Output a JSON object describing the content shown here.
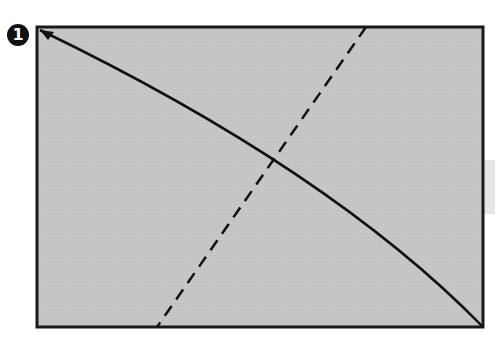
{
  "step": {
    "number": "1"
  },
  "diagram": {
    "paper": {
      "x": 37,
      "y": 27,
      "width": 446,
      "height": 300,
      "fill": "#c4c4c4",
      "stroke": "#1a1a1a"
    },
    "fold_arrow": {
      "from": [
        483,
        327
      ],
      "to": [
        40,
        30
      ],
      "type": "curved-arrow"
    },
    "dashed_crease": {
      "from": [
        366,
        27
      ],
      "to": [
        157,
        327
      ],
      "type": "valley-fold-line"
    },
    "side_tab": {
      "fill": "#e6e6e6"
    }
  }
}
